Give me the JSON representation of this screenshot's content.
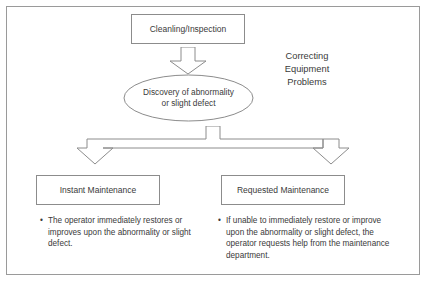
{
  "diagram": {
    "title_block": {
      "label": "Cleanling/Inspection"
    },
    "heading": {
      "lines": [
        "Correcting",
        "Equipment",
        "Problems"
      ]
    },
    "oval": {
      "line1": "Discovery of abnormality",
      "line2": "or slight defect"
    },
    "branches": [
      {
        "box_label": "Instant Maintenance",
        "bullet_marker": "•",
        "bullet_text": "The operator immediately restores or improves upon the abnormality or slight defect."
      },
      {
        "box_label": "Requested Maintenance",
        "bullet_marker": "•",
        "bullet_text": "If unable to immediately restore or improve upon the abnormality or slight defect, the operator requests help from the maintenance department."
      }
    ],
    "connectors": {
      "top_arrow": "down-arrow-icon",
      "split_arrow": "split-down-arrow-icon"
    },
    "colors": {
      "stroke": "#8c8c8c",
      "frame": "#9a9a9a",
      "text": "#3a3a3a",
      "background": "#ffffff"
    }
  }
}
